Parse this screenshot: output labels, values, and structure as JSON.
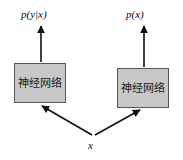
{
  "figure": {
    "type": "flow-diagram",
    "width": 183,
    "height": 160,
    "background_color": "#ffffff",
    "stroke_color": "#111111",
    "box_fill_color": "#c8c8c8",
    "box_border_color": "#555555"
  },
  "nodes": [
    {
      "id": "left-network",
      "label": "神经网络",
      "x": 14,
      "y": 63,
      "width": 52,
      "height": 40
    },
    {
      "id": "right-network",
      "label": "神经网络",
      "x": 117,
      "y": 68,
      "width": 52,
      "height": 40
    }
  ],
  "labels": {
    "left_output": "p(y|x)",
    "right_output": "p(x)",
    "input": "x"
  },
  "edges": [
    {
      "id": "input-to-left",
      "from": "input",
      "to": "left-network",
      "arrowhead": "to"
    },
    {
      "id": "input-to-right",
      "from": "input",
      "to": "right-network",
      "arrowhead": "to"
    },
    {
      "id": "left-to-output",
      "from": "left-network",
      "to": "left_output",
      "arrowhead": "to"
    },
    {
      "id": "right-to-output",
      "from": "right-network",
      "to": "right_output",
      "arrowhead": "to"
    }
  ]
}
